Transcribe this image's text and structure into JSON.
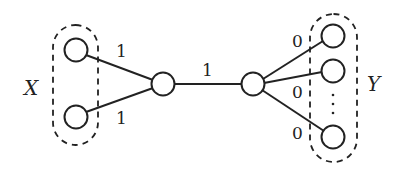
{
  "diagram": {
    "sets": {
      "left": {
        "label": "X"
      },
      "right": {
        "label": "Y"
      }
    },
    "edges": {
      "x_top_to_hub_left": {
        "weight": "1"
      },
      "x_bottom_to_hub_left": {
        "weight": "1"
      },
      "hub_left_to_hub_right": {
        "weight": "1"
      },
      "hub_right_to_y1": {
        "weight": "0"
      },
      "hub_right_to_y2": {
        "weight": "0"
      },
      "hub_right_to_yn": {
        "weight": "0"
      }
    },
    "ellipsis": "⋮",
    "colors": {
      "stroke": "#222222",
      "background": "#ffffff"
    }
  }
}
